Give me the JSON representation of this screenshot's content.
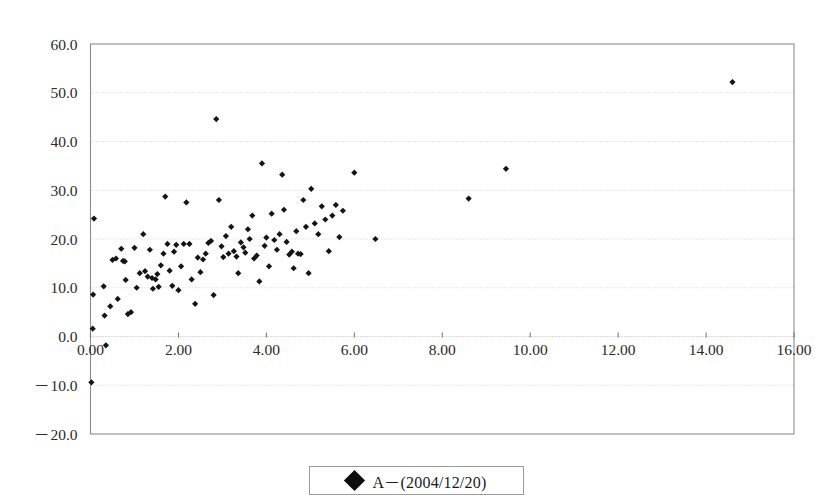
{
  "chart_data": {
    "type": "scatter",
    "title": "",
    "xlabel": "",
    "ylabel": "",
    "xlim": [
      0.0,
      16.0
    ],
    "ylim": [
      -20.0,
      60.0
    ],
    "xticks": [
      0.0,
      2.0,
      4.0,
      6.0,
      8.0,
      10.0,
      12.0,
      14.0,
      16.0
    ],
    "xtick_labels": [
      "0.00",
      "2.00",
      "4.00",
      "6.00",
      "8.00",
      "10.00",
      "12.00",
      "14.00",
      "16.00"
    ],
    "yticks": [
      -20.0,
      -10.0,
      0.0,
      10.0,
      20.0,
      30.0,
      40.0,
      50.0,
      60.0
    ],
    "ytick_labels": [
      "－20.0",
      "－10.0",
      "0.0",
      "10.0",
      "20.0",
      "30.0",
      "40.0",
      "50.0",
      "60.0"
    ],
    "grid": "horizontal-dotted",
    "legend_position": "bottom-center",
    "marker": "filled-diamond",
    "marker_color": "#141414",
    "series": [
      {
        "name": "A－(2004/12/20)",
        "points": [
          [
            0.02,
            -9.4
          ],
          [
            0.05,
            1.6
          ],
          [
            0.06,
            8.6
          ],
          [
            0.08,
            24.2
          ],
          [
            0.3,
            10.3
          ],
          [
            0.32,
            4.3
          ],
          [
            0.35,
            -1.8
          ],
          [
            0.45,
            6.2
          ],
          [
            0.5,
            15.7
          ],
          [
            0.58,
            16.0
          ],
          [
            0.62,
            7.7
          ],
          [
            0.7,
            18.0
          ],
          [
            0.74,
            15.5
          ],
          [
            0.78,
            15.4
          ],
          [
            0.8,
            11.6
          ],
          [
            0.85,
            4.6
          ],
          [
            0.92,
            5.0
          ],
          [
            1.0,
            18.2
          ],
          [
            1.05,
            10.0
          ],
          [
            1.12,
            13.0
          ],
          [
            1.2,
            21.0
          ],
          [
            1.24,
            13.4
          ],
          [
            1.3,
            12.3
          ],
          [
            1.35,
            17.8
          ],
          [
            1.4,
            12.0
          ],
          [
            1.42,
            9.8
          ],
          [
            1.48,
            11.7
          ],
          [
            1.52,
            12.8
          ],
          [
            1.55,
            10.2
          ],
          [
            1.6,
            14.6
          ],
          [
            1.66,
            17.0
          ],
          [
            1.7,
            28.7
          ],
          [
            1.75,
            19.0
          ],
          [
            1.8,
            13.5
          ],
          [
            1.86,
            10.4
          ],
          [
            1.9,
            17.4
          ],
          [
            1.95,
            18.8
          ],
          [
            2.0,
            9.5
          ],
          [
            2.06,
            14.4
          ],
          [
            2.12,
            19.0
          ],
          [
            2.18,
            27.5
          ],
          [
            2.25,
            19.0
          ],
          [
            2.3,
            11.7
          ],
          [
            2.38,
            6.7
          ],
          [
            2.44,
            16.2
          ],
          [
            2.5,
            13.2
          ],
          [
            2.56,
            15.8
          ],
          [
            2.62,
            17.0
          ],
          [
            2.68,
            19.2
          ],
          [
            2.74,
            19.6
          ],
          [
            2.8,
            8.5
          ],
          [
            2.86,
            44.6
          ],
          [
            2.92,
            28.0
          ],
          [
            2.98,
            18.5
          ],
          [
            3.02,
            16.3
          ],
          [
            3.08,
            20.6
          ],
          [
            3.14,
            17.0
          ],
          [
            3.2,
            22.5
          ],
          [
            3.26,
            17.5
          ],
          [
            3.32,
            16.4
          ],
          [
            3.36,
            13.0
          ],
          [
            3.42,
            19.3
          ],
          [
            3.48,
            18.3
          ],
          [
            3.52,
            17.2
          ],
          [
            3.58,
            22.0
          ],
          [
            3.62,
            20.0
          ],
          [
            3.68,
            24.8
          ],
          [
            3.72,
            16.0
          ],
          [
            3.78,
            16.6
          ],
          [
            3.84,
            11.3
          ],
          [
            3.9,
            35.5
          ],
          [
            3.96,
            18.6
          ],
          [
            4.0,
            20.3
          ],
          [
            4.06,
            14.4
          ],
          [
            4.12,
            25.2
          ],
          [
            4.18,
            19.8
          ],
          [
            4.24,
            17.8
          ],
          [
            4.3,
            21.0
          ],
          [
            4.36,
            33.2
          ],
          [
            4.4,
            26.0
          ],
          [
            4.46,
            19.4
          ],
          [
            4.52,
            16.8
          ],
          [
            4.58,
            17.4
          ],
          [
            4.62,
            14.0
          ],
          [
            4.68,
            21.6
          ],
          [
            4.72,
            17.0
          ],
          [
            4.78,
            16.9
          ],
          [
            4.84,
            28.0
          ],
          [
            4.9,
            22.5
          ],
          [
            4.96,
            13.0
          ],
          [
            5.02,
            30.3
          ],
          [
            5.1,
            23.2
          ],
          [
            5.18,
            21.0
          ],
          [
            5.26,
            26.7
          ],
          [
            5.34,
            24.0
          ],
          [
            5.42,
            17.5
          ],
          [
            5.5,
            24.8
          ],
          [
            5.58,
            27.0
          ],
          [
            5.66,
            20.4
          ],
          [
            5.74,
            25.8
          ],
          [
            6.0,
            33.6
          ],
          [
            6.48,
            20.0
          ],
          [
            8.6,
            28.3
          ],
          [
            9.45,
            34.4
          ],
          [
            14.6,
            52.2
          ]
        ]
      }
    ]
  },
  "legend": {
    "label": "A－(2004/12/20)",
    "marker_icon": "filled-diamond-icon"
  }
}
